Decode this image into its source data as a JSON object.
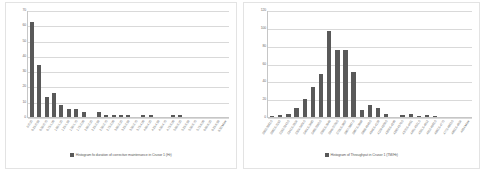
{
  "page": {
    "background": "#ffffff",
    "bar_color": "#595959",
    "grid_color": "#d9d9d9",
    "axis_color": "#c6c6c6",
    "panel_border": "#e3e3e3"
  },
  "chart_data": [
    {
      "id": "left",
      "type": "bar",
      "title": "",
      "xlabel": "",
      "ylabel": "",
      "ylim": [
        0,
        70
      ],
      "yticks": [
        0,
        10,
        20,
        30,
        40,
        50,
        60,
        70
      ],
      "grid": true,
      "legend_position": "bottom",
      "legend": [
        "Histogram fo duration of corrective maintenance in Crusor 1 (Hr)"
      ],
      "categories": [
        "0-0.25",
        "0.25-0.50",
        "0.50-0.75",
        "0.75-1.00",
        "1.00-1.25",
        "1.25-1.50",
        "1.50-1.75",
        "1.75-2.00",
        "2.00-2.25",
        "2.25-2.50",
        "2.50-2.75",
        "2.75-3.00",
        "3.00-3.25",
        "3.25-3.50",
        "3.50-3.75",
        "3.75-4.00",
        "4.00-4.25",
        "4.25-4.50",
        "4.50-4.75",
        "4.75-5.00",
        "5.00-5.25",
        "5.25-5.50",
        "5.50-5.75",
        "5.75-6.00",
        "6.00-6.25",
        "6.25-6.50",
        "6.50 More"
      ],
      "values": [
        62,
        34,
        13,
        16,
        8,
        5,
        5,
        3,
        0,
        3,
        1,
        1,
        1,
        1,
        0,
        1,
        1,
        0,
        0,
        1,
        1,
        0,
        0,
        0,
        0,
        0,
        0
      ],
      "series": [
        {
          "name": "Histogram fo duration of corrective maintenance in Crusor 1 (Hr)",
          "values": [
            62,
            34,
            13,
            16,
            8,
            5,
            5,
            3,
            0,
            3,
            1,
            1,
            1,
            1,
            0,
            1,
            1,
            0,
            0,
            1,
            1,
            0,
            0,
            0,
            0,
            0,
            0
          ]
        }
      ]
    },
    {
      "id": "right",
      "type": "bar",
      "title": "",
      "xlabel": "",
      "ylabel": "",
      "ylim": [
        0,
        120
      ],
      "yticks": [
        0,
        20,
        40,
        60,
        80,
        100,
        120
      ],
      "grid": true,
      "legend_position": "bottom",
      "legend": [
        "Histogram of Throughput in Crusor 1 (TM/Hr)"
      ],
      "categories": [
        "3002-3082.5",
        "3082.5-3163",
        "3163-3243.5",
        "3243.5-3324",
        "3324-3404.5",
        "3404.5-3485",
        "3485-3565.5",
        "3565.5-3646",
        "3646-3726.5",
        "3726.5-3807",
        "3807-3887.5",
        "3887.5-3968",
        "3968-4048.5",
        "4048.5-4129",
        "4129-4209.5",
        "4209.5-4290",
        "4290-4370.5",
        "4370.5-4451",
        "4451-4531.5",
        "4531.5-4612",
        "4612-4692.5",
        "4692.5-4773",
        "4773-4853.5",
        "4853.5-4934",
        "4934-More"
      ],
      "values": [
        1,
        2,
        3,
        10,
        20,
        34,
        48,
        97,
        75,
        75,
        51,
        8,
        13,
        10,
        3,
        0,
        2,
        3,
        1,
        2,
        1,
        0,
        0,
        0,
        0
      ],
      "series": [
        {
          "name": "Histogram of Throughput in Crusor 1 (TM/Hr)",
          "values": [
            1,
            2,
            3,
            10,
            20,
            34,
            48,
            97,
            75,
            75,
            51,
            8,
            13,
            10,
            3,
            0,
            2,
            3,
            1,
            2,
            1,
            0,
            0,
            0,
            0
          ]
        }
      ]
    }
  ]
}
